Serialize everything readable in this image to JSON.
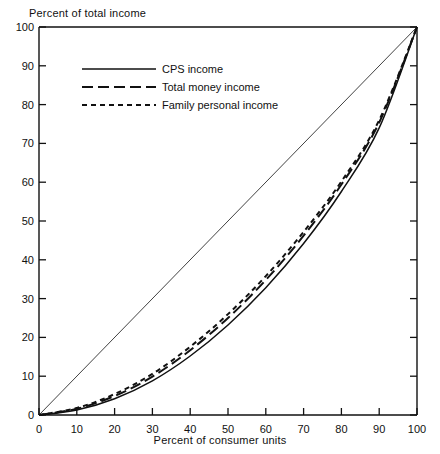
{
  "chart_data": {
    "type": "line",
    "title": "",
    "xlabel": "Percent of consumer units",
    "ylabel": "Percent of total income",
    "xlim": [
      0,
      100
    ],
    "ylim": [
      0,
      100
    ],
    "grid": false,
    "legend_position": "top-left",
    "xticks": [
      "0",
      "10",
      "20",
      "30",
      "40",
      "50",
      "60",
      "70",
      "80",
      "90",
      "100"
    ],
    "yticks": [
      "0",
      "10",
      "20",
      "30",
      "40",
      "50",
      "60",
      "70",
      "80",
      "90",
      "100"
    ],
    "x": [
      0,
      10,
      20,
      30,
      40,
      50,
      60,
      70,
      80,
      90,
      100
    ],
    "series": [
      {
        "name": "CPS income",
        "style": "solid",
        "values": [
          0,
          1.3,
          4.2,
          8.8,
          15.2,
          23.2,
          32.8,
          44.2,
          57.6,
          74.0,
          100
        ]
      },
      {
        "name": "Total money income",
        "style": "long-dash",
        "values": [
          0,
          1.6,
          4.9,
          9.9,
          16.7,
          25.0,
          34.8,
          46.2,
          59.4,
          75.4,
          100
        ]
      },
      {
        "name": "Family personal income",
        "style": "short-dash",
        "values": [
          0,
          1.8,
          5.4,
          10.6,
          17.6,
          26.0,
          35.8,
          47.2,
          60.2,
          76.0,
          100
        ]
      }
    ],
    "reference_line": {
      "name": "line-of-equality",
      "from": [
        0,
        0
      ],
      "to": [
        100,
        100
      ]
    }
  },
  "legend": {
    "items": [
      {
        "label": "CPS income",
        "style": "solid"
      },
      {
        "label": "Total money income",
        "style": "long-dash"
      },
      {
        "label": "Family personal income",
        "style": "short-dash"
      }
    ]
  }
}
